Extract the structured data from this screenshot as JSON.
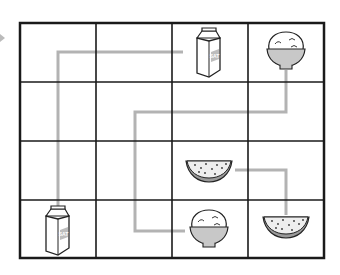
{
  "puzzle": {
    "title": "",
    "grid": {
      "rows": 4,
      "cols": 4
    },
    "colors": {
      "grid_line": "#1a1a1a",
      "path": "#b3b3b3",
      "bowl": "#c8c8c8",
      "melon_rind": "#9a9a9a"
    },
    "cells": [
      {
        "row": 0,
        "col": 2,
        "item": "milk-carton",
        "label": "SAT"
      },
      {
        "row": 0,
        "col": 3,
        "item": "rice-bowl"
      },
      {
        "row": 2,
        "col": 2,
        "item": "watermelon-slice"
      },
      {
        "row": 3,
        "col": 0,
        "item": "milk-carton",
        "label": "SAT"
      },
      {
        "row": 3,
        "col": 2,
        "item": "rice-bowl"
      },
      {
        "row": 3,
        "col": 3,
        "item": "watermelon-slice"
      }
    ],
    "paths": [
      {
        "connects": [
          "milk-carton r3c0",
          "milk-carton r0c2"
        ]
      },
      {
        "connects": [
          "rice-bowl r0c3",
          "rice-bowl r3c2"
        ]
      },
      {
        "connects": [
          "watermelon-slice r2c2",
          "watermelon-slice r3c3"
        ]
      }
    ]
  }
}
